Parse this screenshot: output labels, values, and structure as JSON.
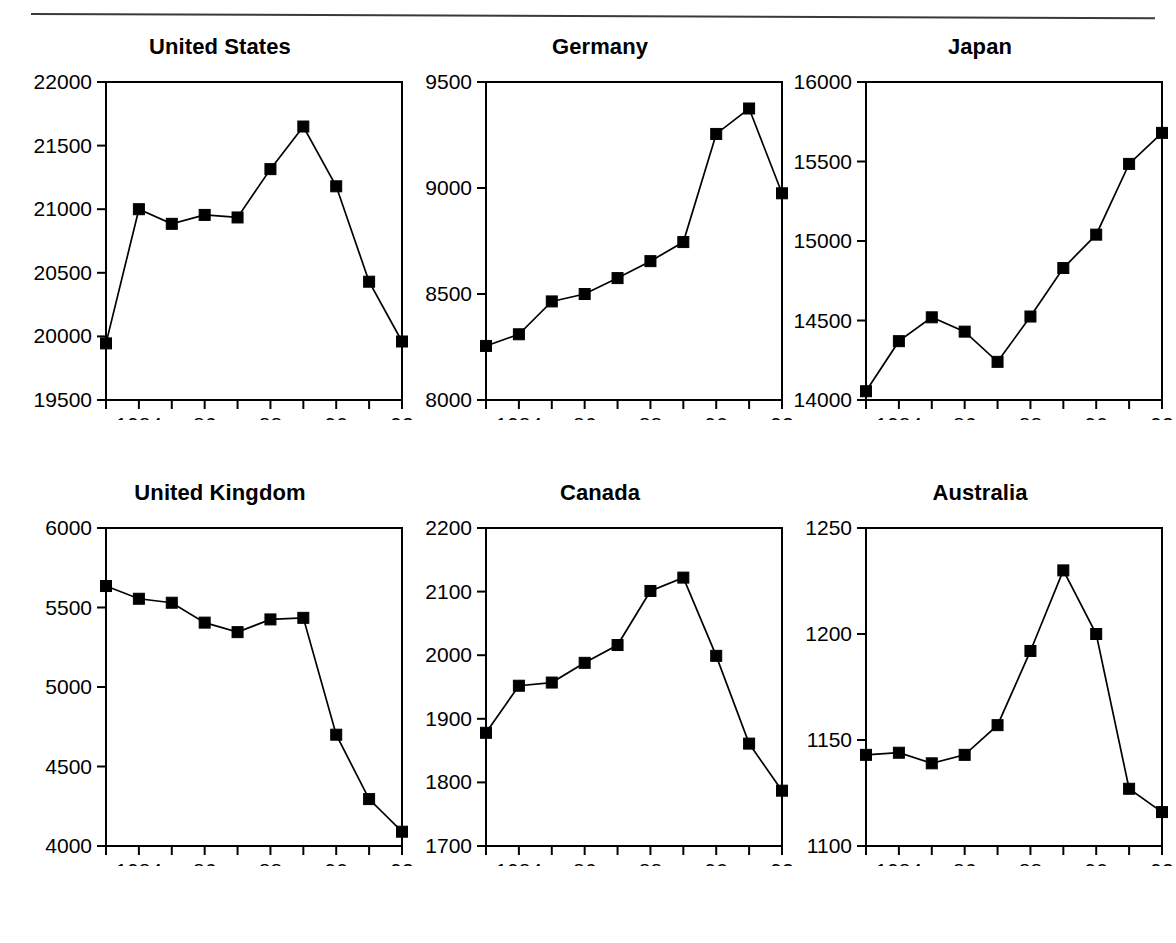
{
  "page": {
    "header_note": "",
    "background": "#ffffff",
    "ink": "#000000"
  },
  "panels": [
    {
      "key": "united_states",
      "title": "United States"
    },
    {
      "key": "germany",
      "title": "Germany"
    },
    {
      "key": "japan",
      "title": "Japan"
    },
    {
      "key": "united_kingdom",
      "title": "United Kingdom"
    },
    {
      "key": "canada",
      "title": "Canada"
    },
    {
      "key": "australia",
      "title": "Australia"
    }
  ],
  "chart_data": [
    {
      "type": "line",
      "title": "United States",
      "xlabel": "",
      "ylabel": "",
      "x": [
        1983,
        1984,
        1985,
        1986,
        1987,
        1988,
        1989,
        1990,
        1991,
        1992
      ],
      "values": [
        19945,
        21000,
        20885,
        20955,
        20935,
        21315,
        21650,
        21180,
        20430,
        19960
      ],
      "ylim": [
        19500,
        22000
      ],
      "yticks": [
        19500,
        20000,
        20500,
        21000,
        21500,
        22000
      ],
      "ytick_labels": [
        "19500",
        "20000",
        "20500",
        "21000",
        "21500",
        "22000"
      ],
      "xlim": [
        1983,
        1992
      ],
      "xticks": [
        1983,
        1984,
        1985,
        1986,
        1987,
        1988,
        1989,
        1990,
        1991,
        1992
      ],
      "xtick_labels": [
        "",
        "1984",
        "",
        "86",
        "",
        "88",
        "",
        "90",
        "",
        "92"
      ],
      "grid": false,
      "legend": "none",
      "marker": "square",
      "color": "#000000"
    },
    {
      "type": "line",
      "title": "Germany",
      "xlabel": "",
      "ylabel": "",
      "x": [
        1983,
        1984,
        1985,
        1986,
        1987,
        1988,
        1989,
        1990,
        1991,
        1992
      ],
      "values": [
        8255,
        8310,
        8465,
        8500,
        8575,
        8655,
        8745,
        9255,
        9375,
        8975
      ],
      "ylim": [
        8000,
        9500
      ],
      "yticks": [
        8000,
        8500,
        9000,
        9500
      ],
      "ytick_labels": [
        "8000",
        "8500",
        "9000",
        "9500"
      ],
      "xlim": [
        1983,
        1992
      ],
      "xticks": [
        1983,
        1984,
        1985,
        1986,
        1987,
        1988,
        1989,
        1990,
        1991,
        1992
      ],
      "xtick_labels": [
        "",
        "1984",
        "",
        "86",
        "",
        "88",
        "",
        "90",
        "",
        "92"
      ],
      "grid": false,
      "legend": "none",
      "marker": "square",
      "color": "#000000"
    },
    {
      "type": "line",
      "title": "Japan",
      "xlabel": "",
      "ylabel": "",
      "x": [
        1983,
        1984,
        1985,
        1986,
        1987,
        1988,
        1989,
        1990,
        1991,
        1992
      ],
      "values": [
        14055,
        14370,
        14520,
        14430,
        14240,
        14525,
        14830,
        15040,
        15485,
        15680
      ],
      "ylim": [
        14000,
        16000
      ],
      "yticks": [
        14000,
        14500,
        15000,
        15500,
        16000
      ],
      "ytick_labels": [
        "14000",
        "14500",
        "15000",
        "15500",
        "16000"
      ],
      "xlim": [
        1983,
        1992
      ],
      "xticks": [
        1983,
        1984,
        1985,
        1986,
        1987,
        1988,
        1989,
        1990,
        1991,
        1992
      ],
      "xtick_labels": [
        "",
        "1984",
        "",
        "86",
        "",
        "88",
        "",
        "90",
        "",
        "92"
      ],
      "grid": false,
      "legend": "none",
      "marker": "square",
      "color": "#000000"
    },
    {
      "type": "line",
      "title": "United Kingdom",
      "xlabel": "",
      "ylabel": "",
      "x": [
        1983,
        1984,
        1985,
        1986,
        1987,
        1988,
        1989,
        1990,
        1991,
        1992
      ],
      "values": [
        5635,
        5555,
        5530,
        5405,
        5345,
        5425,
        5435,
        4700,
        4295,
        4090
      ],
      "ylim": [
        4000,
        6000
      ],
      "yticks": [
        4000,
        4500,
        5000,
        5500,
        6000
      ],
      "ytick_labels": [
        "4000",
        "4500",
        "5000",
        "5500",
        "6000"
      ],
      "xlim": [
        1983,
        1992
      ],
      "xticks": [
        1983,
        1984,
        1985,
        1986,
        1987,
        1988,
        1989,
        1990,
        1991,
        1992
      ],
      "xtick_labels": [
        "",
        "1984",
        "",
        "86",
        "",
        "88",
        "",
        "90",
        "",
        "92"
      ],
      "grid": false,
      "legend": "none",
      "marker": "square",
      "color": "#000000"
    },
    {
      "type": "line",
      "title": "Canada",
      "xlabel": "",
      "ylabel": "",
      "x": [
        1983,
        1984,
        1985,
        1986,
        1987,
        1988,
        1989,
        1990,
        1991,
        1992
      ],
      "values": [
        1878,
        1952,
        1957,
        1988,
        2016,
        2101,
        2122,
        1999,
        1861,
        1787
      ],
      "ylim": [
        1700,
        2200
      ],
      "yticks": [
        1700,
        1800,
        1900,
        2000,
        2100,
        2200
      ],
      "ytick_labels": [
        "1700",
        "1800",
        "1900",
        "2000",
        "2100",
        "2200"
      ],
      "xlim": [
        1983,
        1992
      ],
      "xticks": [
        1983,
        1984,
        1985,
        1986,
        1987,
        1988,
        1989,
        1990,
        1991,
        1992
      ],
      "xtick_labels": [
        "",
        "1984",
        "",
        "86",
        "",
        "88",
        "",
        "90",
        "",
        "92"
      ],
      "grid": false,
      "legend": "none",
      "marker": "square",
      "color": "#000000"
    },
    {
      "type": "line",
      "title": "Australia",
      "xlabel": "",
      "ylabel": "",
      "x": [
        1983,
        1984,
        1985,
        1986,
        1987,
        1988,
        1989,
        1990,
        1991,
        1992
      ],
      "values": [
        1143,
        1144,
        1139,
        1143,
        1157,
        1192,
        1230,
        1200,
        1127,
        1116
      ],
      "ylim": [
        1100,
        1250
      ],
      "yticks": [
        1100,
        1150,
        1200,
        1250
      ],
      "ytick_labels": [
        "1100",
        "1150",
        "1200",
        "1250"
      ],
      "xlim": [
        1983,
        1992
      ],
      "xticks": [
        1983,
        1984,
        1985,
        1986,
        1987,
        1988,
        1989,
        1990,
        1991,
        1992
      ],
      "xtick_labels": [
        "",
        "1984",
        "",
        "86",
        "",
        "88",
        "",
        "90",
        "",
        "92"
      ],
      "grid": false,
      "legend": "none",
      "marker": "square",
      "color": "#000000"
    }
  ]
}
